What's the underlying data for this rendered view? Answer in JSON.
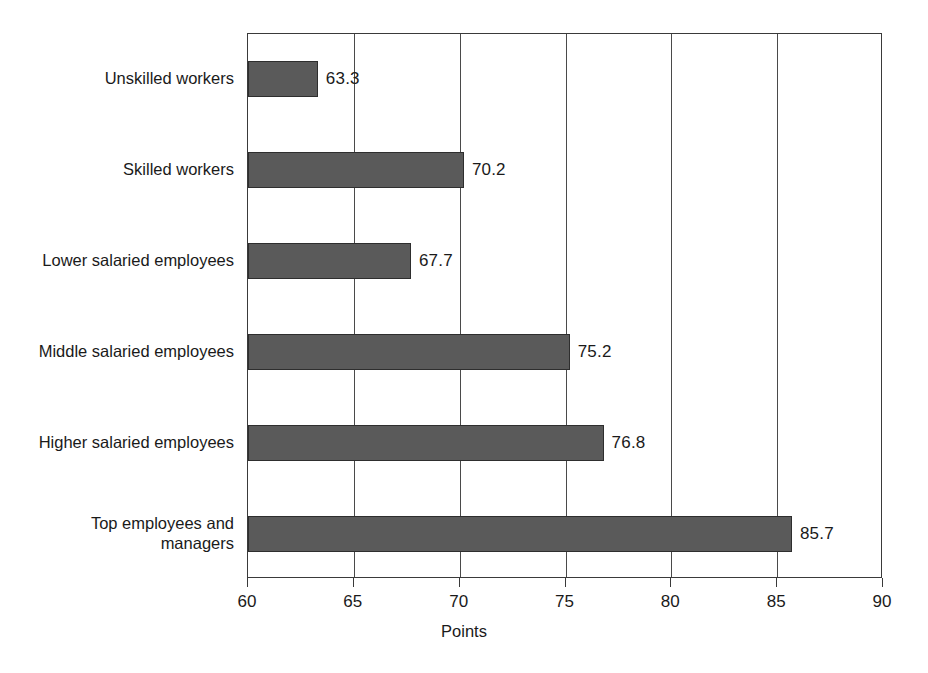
{
  "chart_data": {
    "type": "bar",
    "orientation": "horizontal",
    "title": "",
    "xlabel": "Points",
    "ylabel": "",
    "xlim": [
      60,
      90
    ],
    "xticks": [
      60,
      65,
      70,
      75,
      80,
      85,
      90
    ],
    "xtick_labels": [
      "60",
      "65",
      "70",
      "75",
      "80",
      "85",
      "90"
    ],
    "grid": true,
    "legend": null,
    "categories": [
      "Unskilled workers",
      "Skilled workers",
      "Lower salaried employees",
      "Middle salaried employees",
      "Higher salaried employees",
      "Top employees and\nmanagers"
    ],
    "values": [
      63.3,
      70.2,
      67.7,
      75.2,
      76.8,
      85.7
    ],
    "value_labels": [
      "63.3",
      "70.2",
      "67.7",
      "75.2",
      "76.8",
      "85.7"
    ],
    "bar_color": "#5a5a5a",
    "bar_border_color": "#2e2e2e",
    "background_color": "#ffffff",
    "axis_color": "#3a3a3a"
  }
}
